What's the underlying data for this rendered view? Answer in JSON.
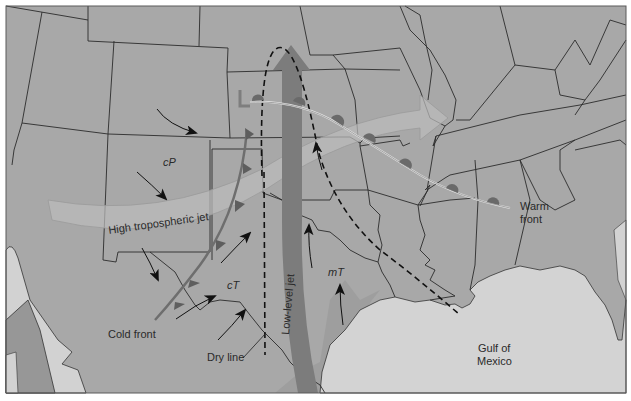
{
  "map": {
    "title": "Severe weather setup over the central United States",
    "labels": {
      "cold_front": "Cold front",
      "warm_front_line1": "Warm",
      "warm_front_line2": "front",
      "dry_line": "Dry line",
      "low_level_jet": "Low-level jet",
      "high_jet": "High tropospheric jet",
      "gulf_line1": "Gulf of",
      "gulf_line2": "Mexico",
      "cP": "cP",
      "cT": "cT",
      "mT": "mT",
      "low": "L"
    },
    "colors": {
      "land": "#a6a6a6",
      "land_dark": "#8f8f8f",
      "water": "#d4d4d4",
      "border": "#2b2b2b",
      "jet_low": "#7d7d7d",
      "jet_high": "#b9b9b9",
      "front_symbol": "#6a6a6a",
      "front_line": "#e8e8e8",
      "frame": "#5a5a5a"
    }
  }
}
